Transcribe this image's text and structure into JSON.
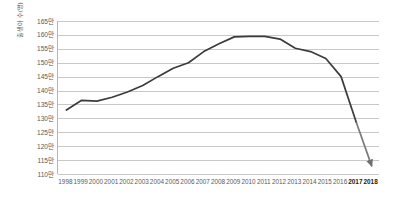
{
  "chart_data": {
    "type": "line",
    "title": "",
    "subtitle": "",
    "xlabel": "",
    "ylabel": "출생아 수(명)",
    "unit_suffix": "만",
    "ylim": [
      110,
      165
    ],
    "ytick_step": 5,
    "ytick_labels": [
      "165만",
      "160만",
      "155만",
      "150만",
      "145만",
      "140만",
      "135만",
      "130만",
      "125만",
      "120만",
      "115만",
      "110만"
    ],
    "ytick_values": [
      165,
      160,
      155,
      150,
      145,
      140,
      135,
      130,
      125,
      120,
      115,
      110
    ],
    "grid": true,
    "grid_axis": "y",
    "legend": false,
    "legend_position": "none",
    "line_color": "#3b3b3b",
    "projection_color": "#7a7a7a",
    "arrow_end": true,
    "categories": [
      "1998",
      "1999",
      "2000",
      "2001",
      "2002",
      "2003",
      "2004",
      "2005",
      "2006",
      "2007",
      "2008",
      "2009",
      "2010",
      "2011",
      "2012",
      "2013",
      "2014",
      "2015",
      "2016",
      "2017",
      "2018"
    ],
    "highlight_categories": [
      "2017",
      "2018"
    ],
    "values": [
      133.0,
      136.5,
      136.2,
      137.6,
      139.5,
      141.8,
      145.0,
      148.0,
      150.0,
      154.0,
      156.8,
      159.3,
      159.5,
      159.5,
      158.5,
      155.2,
      154.0,
      151.5,
      145.0,
      128.5,
      113.0
    ],
    "series": [
      {
        "name": "출생아 수",
        "values": [
          133.0,
          136.5,
          136.2,
          137.6,
          139.5,
          141.8,
          145.0,
          148.0,
          150.0,
          154.0,
          156.8,
          159.3,
          159.5,
          159.5,
          158.5,
          155.2,
          154.0,
          151.5,
          145.0,
          128.5,
          113.0
        ]
      }
    ]
  }
}
